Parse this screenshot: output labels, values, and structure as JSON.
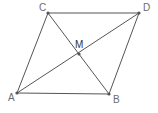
{
  "diagram": {
    "type": "parallelogram-with-diagonals",
    "stroke_color": "#555555",
    "point_color": "#555555",
    "points": {
      "A": {
        "label": "A",
        "x": 17,
        "y": 93,
        "label_x": 8,
        "label_y": 101
      },
      "B": {
        "label": "B",
        "x": 109,
        "y": 94,
        "label_x": 113,
        "label_y": 103
      },
      "C": {
        "label": "C",
        "x": 48,
        "y": 13,
        "label_x": 39,
        "label_y": 11
      },
      "D": {
        "label": "D",
        "x": 139,
        "y": 13,
        "label_x": 143,
        "label_y": 11
      },
      "M": {
        "label": "M",
        "x": 79,
        "y": 54,
        "label_x": 75,
        "label_y": 48
      }
    },
    "segments": [
      [
        "A",
        "B"
      ],
      [
        "B",
        "D"
      ],
      [
        "D",
        "C"
      ],
      [
        "C",
        "A"
      ],
      [
        "A",
        "D"
      ],
      [
        "C",
        "B"
      ]
    ]
  }
}
